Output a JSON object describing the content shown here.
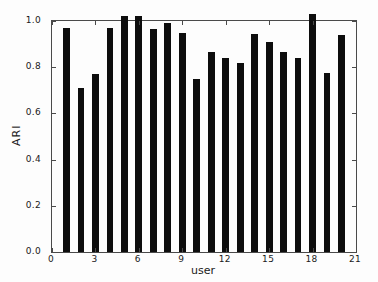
{
  "chart_data": {
    "type": "bar",
    "title": "",
    "xlabel": "user",
    "ylabel": "ARI",
    "xlim": [
      0,
      21
    ],
    "ylim": [
      0,
      1.0
    ],
    "grid": false,
    "legend": null,
    "bar_width_units": 0.47,
    "x": [
      1,
      2,
      3,
      4,
      5,
      6,
      7,
      8,
      9,
      10,
      11,
      12,
      13,
      14,
      15,
      16,
      17,
      18,
      19,
      20
    ],
    "values": [
      0.97,
      0.71,
      0.77,
      0.97,
      1.02,
      1.02,
      0.965,
      0.99,
      0.95,
      0.75,
      0.865,
      0.84,
      0.82,
      0.945,
      0.91,
      0.865,
      0.84,
      1.03,
      0.775,
      0.94
    ],
    "x_ticks": [
      0,
      3,
      6,
      9,
      12,
      15,
      18,
      21
    ],
    "x_tick_labels": [
      "0",
      "3",
      "6",
      "9",
      "12",
      "15",
      "18",
      "21"
    ],
    "y_ticks": [
      0.0,
      0.2,
      0.4,
      0.6,
      0.8,
      1.0
    ],
    "y_tick_labels": [
      "0.0",
      "0.2",
      "0.4",
      "0.6",
      "0.8",
      "1.0"
    ],
    "colors": {
      "bar": "#0d0d0d",
      "spine": "#4a4a4a",
      "text": "#1a1a1a",
      "background": "#fdfdfd"
    }
  }
}
